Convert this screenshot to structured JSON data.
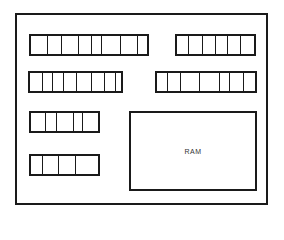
{
  "diagram": {
    "ram_label": "RAM",
    "modules": [
      {
        "name": "module-row1-left",
        "cells": 8
      },
      {
        "name": "module-row1-right",
        "cells": 6
      },
      {
        "name": "module-row2-left",
        "cells": 8
      },
      {
        "name": "module-row2-right",
        "cells": 7
      },
      {
        "name": "module-row3-left",
        "cells": 5
      },
      {
        "name": "module-row4-left",
        "cells": 4
      }
    ]
  }
}
